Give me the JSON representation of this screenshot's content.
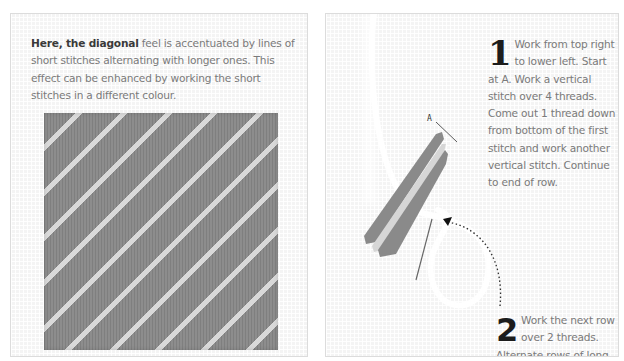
{
  "left_panel": {
    "caption_bold": "Here, the diagonal",
    "caption_rest": " feel is accentuated by lines of short stitches alternating with longer ones. This effect can be enhanced by working the short stitches in a different colour.",
    "image_alt": "Diagonal stitch sample: bands of long grey stitches alternating with rows of short cream stitches",
    "colors": {
      "long_stitch": "#8d8d8d",
      "short_stitch": "#d9d9d9",
      "canvas": "#f4f4f4"
    }
  },
  "right_panel": {
    "label_a": "A",
    "steps": [
      {
        "number": "1",
        "text": "Work from top right to lower left. Start at A. Work a vertical stitch over 4 threads. Come out 1 thread down from bottom of the first stitch and work another vertical stitch. Continue to end of row."
      },
      {
        "number": "2",
        "text": "Work the next row over 2 threads. Alternate rows of long and short stitches."
      }
    ],
    "icons": [
      "needle-icon",
      "thread-loop-icon",
      "dotted-arrow-icon",
      "pointer-line-icon"
    ]
  }
}
